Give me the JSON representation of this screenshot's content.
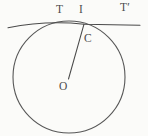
{
  "figure": {
    "type": "geometry-diagram",
    "background_color": "#fbfbf9",
    "stroke_color": "#4d4d4d",
    "labels": {
      "tangent_left": "T",
      "tangent_middle": "I",
      "tangent_right": "T′",
      "contact_point": "C",
      "center_point": "O"
    },
    "geometry": {
      "circle": {
        "cx": 69,
        "cy": 77,
        "r": 56
      },
      "tangent_line": {
        "x1": 8,
        "y1": 27.5,
        "x2": 140,
        "y2": 25.0
      },
      "radius_segment": {
        "x1": 69,
        "y1": 77,
        "x2": 84,
        "y2": 24
      },
      "arc_path": "M 8 27.5 Q 45 19 84 24"
    }
  }
}
